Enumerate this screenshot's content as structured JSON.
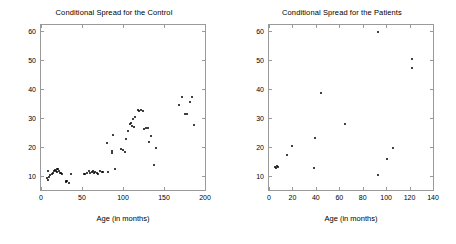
{
  "figure": {
    "background_color": "#ffffff",
    "marker_color": "#000000",
    "axis_color": "#9a9a9a"
  },
  "panels": [
    {
      "key": "control",
      "title": "Conditional Spread for the Control",
      "xlabel": "Age (in months)",
      "ylabel": ""
    },
    {
      "key": "patients",
      "title": "Conditional Spread for the Patients",
      "xlabel": "Age (in months)",
      "ylabel": ""
    }
  ],
  "chart_data": [
    {
      "type": "scatter",
      "title": "Conditional Spread for the Control",
      "xlabel": "Age (in months)",
      "ylabel": "",
      "xlim": [
        0,
        200
      ],
      "ylim": [
        5,
        62
      ],
      "xticks": [
        0,
        50,
        100,
        150,
        200
      ],
      "yticks": [
        10,
        20,
        30,
        40,
        50,
        60
      ],
      "grid": false,
      "legend": "none",
      "marker": "dot",
      "series": [
        {
          "name": "Control",
          "points": [
            [
              7,
              9.2
            ],
            [
              8,
              11.6
            ],
            [
              9,
              8.6
            ],
            [
              10,
              9.4
            ],
            [
              11,
              10.1
            ],
            [
              13,
              10.4
            ],
            [
              15,
              10.8
            ],
            [
              16,
              11.4
            ],
            [
              17,
              12.0
            ],
            [
              18,
              11.6
            ],
            [
              19,
              12.2
            ],
            [
              20,
              11.2
            ],
            [
              21,
              12.3
            ],
            [
              22,
              11.5
            ],
            [
              23,
              11.0
            ],
            [
              24,
              10.9
            ],
            [
              26,
              10.6
            ],
            [
              30,
              8.0
            ],
            [
              31,
              7.9
            ],
            [
              32,
              8.0
            ],
            [
              34,
              7.3
            ],
            [
              36,
              10.4
            ],
            [
              52,
              10.4
            ],
            [
              54,
              10.6
            ],
            [
              56,
              10.8
            ],
            [
              58,
              11.4
            ],
            [
              60,
              10.9
            ],
            [
              62,
              11.1
            ],
            [
              63,
              11.6
            ],
            [
              65,
              10.8
            ],
            [
              66,
              11.2
            ],
            [
              68,
              11.0
            ],
            [
              70,
              10.6
            ],
            [
              72,
              11.5
            ],
            [
              74,
              11.3
            ],
            [
              76,
              11.1
            ],
            [
              80,
              21.2
            ],
            [
              82,
              11.3
            ],
            [
              86,
              17.9
            ],
            [
              87,
              18.4
            ],
            [
              88,
              24.0
            ],
            [
              90,
              12.2
            ],
            [
              98,
              19.2
            ],
            [
              100,
              18.9
            ],
            [
              102,
              18.3
            ],
            [
              104,
              22.6
            ],
            [
              106,
              25.5
            ],
            [
              108,
              27.9
            ],
            [
              110,
              28.3
            ],
            [
              111,
              27.2
            ],
            [
              112,
              29.6
            ],
            [
              113,
              26.9
            ],
            [
              115,
              30.1
            ],
            [
              118,
              32.5
            ],
            [
              120,
              32.3
            ],
            [
              122,
              32.7
            ],
            [
              124,
              32.3
            ],
            [
              126,
              26.2
            ],
            [
              128,
              26.5
            ],
            [
              130,
              26.3
            ],
            [
              132,
              21.5
            ],
            [
              134,
              23.8
            ],
            [
              138,
              13.8
            ],
            [
              140,
              19.4
            ],
            [
              168,
              34.3
            ],
            [
              172,
              37.0
            ],
            [
              176,
              31.2
            ],
            [
              178,
              31.4
            ],
            [
              182,
              35.5
            ],
            [
              184,
              37.0
            ],
            [
              186,
              27.6
            ]
          ]
        }
      ]
    },
    {
      "type": "scatter",
      "title": "Conditional Spread for the Patients",
      "xlabel": "Age (in months)",
      "ylabel": "",
      "xlim": [
        0,
        140
      ],
      "ylim": [
        5,
        62
      ],
      "xticks": [
        0,
        20,
        40,
        60,
        80,
        100,
        120,
        140
      ],
      "yticks": [
        10,
        20,
        30,
        40,
        50,
        60
      ],
      "grid": false,
      "legend": "none",
      "marker": "dot",
      "series": [
        {
          "name": "Patients",
          "points": [
            [
              5,
              12.8
            ],
            [
              6,
              12.6
            ],
            [
              7,
              13.2
            ],
            [
              8,
              12.9
            ],
            [
              15,
              17.0
            ],
            [
              20,
              20.2
            ],
            [
              38,
              12.6
            ],
            [
              39,
              23.1
            ],
            [
              44,
              38.4
            ],
            [
              65,
              27.9
            ],
            [
              93,
              59.7
            ],
            [
              93,
              10.3
            ],
            [
              101,
              15.6
            ],
            [
              106,
              19.6
            ],
            [
              122,
              50.3
            ],
            [
              122,
              47.2
            ]
          ]
        }
      ]
    }
  ]
}
